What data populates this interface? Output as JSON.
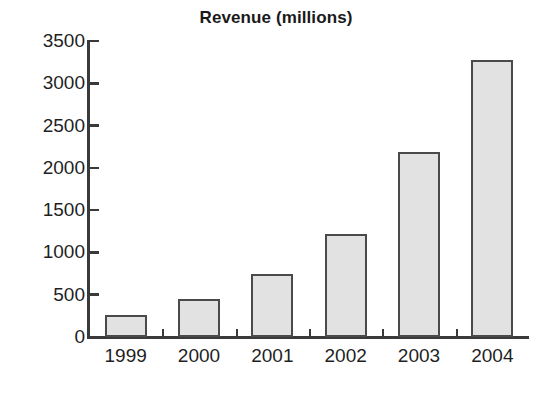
{
  "chart_data": {
    "type": "bar",
    "title": "Revenue (millions)",
    "xlabel": "",
    "ylabel": "",
    "categories": [
      "1999",
      "2000",
      "2001",
      "2002",
      "2003",
      "2004"
    ],
    "values": [
      260,
      450,
      750,
      1220,
      2190,
      3270
    ],
    "series": [
      {
        "name": "Revenue",
        "values": [
          260,
          450,
          750,
          1220,
          2190,
          3270
        ]
      }
    ],
    "ylim": [
      0,
      3500
    ],
    "yticks": [
      0,
      500,
      1000,
      1500,
      2000,
      2500,
      3000,
      3500
    ],
    "ytick_labels": [
      "0",
      "500",
      "1000",
      "1500",
      "2000",
      "2500",
      "3000",
      "3500"
    ],
    "grid": false,
    "legend": false,
    "legend_position": "none",
    "bar_fill_color": "#e2e2e2",
    "bar_border_color": "#4a4a4a",
    "axis_color": "#3a3a3a",
    "text_color": "#1f1f1f",
    "background_color": "#ffffff"
  }
}
